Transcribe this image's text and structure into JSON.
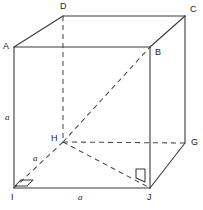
{
  "figure": {
    "shape": "cube",
    "stroke_color": "#3a3a3a",
    "dashed_color": "#4a4a4a",
    "background": "#ffffff",
    "vertices": [
      {
        "name": "A",
        "label": "A",
        "x": 14,
        "y": 47,
        "label_x": 3,
        "label_y": 42,
        "hidden": false
      },
      {
        "name": "B",
        "label": "B",
        "x": 150,
        "y": 47,
        "label_x": 155,
        "label_y": 48,
        "hidden": false
      },
      {
        "name": "C",
        "label": "C",
        "x": 185,
        "y": 16,
        "label_x": 190,
        "label_y": 5,
        "hidden": false
      },
      {
        "name": "D",
        "label": "D",
        "x": 63,
        "y": 16,
        "label_x": 60,
        "label_y": 2,
        "hidden": false
      },
      {
        "name": "G",
        "label": "G",
        "x": 185,
        "y": 143,
        "label_x": 191,
        "label_y": 138,
        "hidden": false
      },
      {
        "name": "H",
        "label": "H",
        "x": 63,
        "y": 142,
        "label_x": 51,
        "label_y": 134,
        "hidden": true
      },
      {
        "name": "I",
        "label": "I",
        "x": 14,
        "y": 188,
        "label_x": 11,
        "label_y": 193,
        "hidden": false
      },
      {
        "name": "J",
        "label": "J",
        "x": 150,
        "y": 188,
        "label_x": 147,
        "label_y": 193,
        "hidden": false
      }
    ],
    "solid_edges": [
      {
        "name": "edge-A-D",
        "from": "A",
        "to": "D"
      },
      {
        "name": "edge-D-C",
        "from": "D",
        "to": "C"
      },
      {
        "name": "edge-A-B",
        "from": "A",
        "to": "B"
      },
      {
        "name": "edge-B-C",
        "from": "B",
        "to": "C"
      },
      {
        "name": "edge-A-I",
        "from": "A",
        "to": "I"
      },
      {
        "name": "edge-B-J",
        "from": "B",
        "to": "J"
      },
      {
        "name": "edge-C-G",
        "from": "C",
        "to": "G"
      },
      {
        "name": "edge-I-J",
        "from": "I",
        "to": "J"
      },
      {
        "name": "edge-J-G",
        "from": "J",
        "to": "G"
      }
    ],
    "dashed_edges": [
      {
        "name": "edge-D-H",
        "from": "D",
        "to": "H"
      },
      {
        "name": "edge-H-G",
        "from": "H",
        "to": "G"
      },
      {
        "name": "edge-H-I",
        "from": "H",
        "to": "I"
      },
      {
        "name": "edge-H-J",
        "from": "H",
        "to": "J"
      },
      {
        "name": "diagonal-H-B",
        "from": "H",
        "to": "B"
      }
    ],
    "edge_labels": [
      {
        "name": "label-side-AI",
        "text": "a",
        "x": 5,
        "y": 113
      },
      {
        "name": "label-side-HI",
        "text": "a",
        "x": 33,
        "y": 154
      },
      {
        "name": "label-side-IJ",
        "text": "a",
        "x": 78,
        "y": 193
      }
    ],
    "right_angle_markers": [
      {
        "name": "right-angle-marker-I",
        "points": "21,180 33,180 27,186 15,186"
      },
      {
        "name": "right-angle-marker-J",
        "points": "136,169 145,169 145,182 136,178"
      }
    ]
  }
}
